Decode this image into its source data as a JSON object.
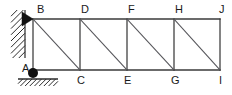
{
  "figure": {
    "background_color": "#ffffff",
    "line_color": "#3a3a3a",
    "label_color": "#1a1a1a",
    "width_px": 232,
    "height_px": 95
  },
  "geometry": {
    "top_chord_y": 19,
    "bottom_chord_y": 70,
    "panel_x": [
      33,
      80,
      127,
      174,
      220
    ],
    "panel_count": 4
  },
  "nodes": [
    {
      "id": "B",
      "label": "B",
      "x": 33,
      "y": 19,
      "chord": "top",
      "label_x": 37,
      "label_y": 13
    },
    {
      "id": "D",
      "label": "D",
      "x": 80,
      "y": 19,
      "chord": "top",
      "label_x": 81,
      "label_y": 13
    },
    {
      "id": "F",
      "label": "F",
      "x": 127,
      "y": 19,
      "chord": "top",
      "label_x": 128,
      "label_y": 13
    },
    {
      "id": "H",
      "label": "H",
      "x": 174,
      "y": 19,
      "chord": "top",
      "label_x": 175,
      "label_y": 13
    },
    {
      "id": "J",
      "label": "J",
      "x": 220,
      "y": 19,
      "chord": "top",
      "label_x": 219,
      "label_y": 13
    },
    {
      "id": "A",
      "label": "A",
      "x": 33,
      "y": 70,
      "chord": "bottom",
      "label_x": 22,
      "label_y": 72
    },
    {
      "id": "C",
      "label": "C",
      "x": 80,
      "y": 70,
      "chord": "bottom",
      "label_x": 77,
      "label_y": 84
    },
    {
      "id": "E",
      "label": "E",
      "x": 127,
      "y": 70,
      "chord": "bottom",
      "label_x": 124,
      "label_y": 84
    },
    {
      "id": "G",
      "label": "G",
      "x": 174,
      "y": 70,
      "chord": "bottom",
      "label_x": 171,
      "label_y": 84
    },
    {
      "id": "I",
      "label": "I",
      "x": 220,
      "y": 70,
      "chord": "bottom",
      "label_x": 219,
      "label_y": 84
    }
  ],
  "members": {
    "top_chord": {
      "from": "B",
      "to": "J",
      "x1": 33,
      "y1": 19,
      "x2": 220,
      "y2": 19
    },
    "bottom_chord": {
      "from": "A",
      "to": "I",
      "x1": 33,
      "y1": 70,
      "x2": 220,
      "y2": 70
    },
    "verticals": [
      {
        "from": "B",
        "to": "A",
        "x": 33,
        "y1": 19,
        "y2": 70
      },
      {
        "from": "D",
        "to": "C",
        "x": 80,
        "y1": 19,
        "y2": 70
      },
      {
        "from": "F",
        "to": "E",
        "x": 127,
        "y1": 19,
        "y2": 70
      },
      {
        "from": "H",
        "to": "G",
        "x": 174,
        "y1": 19,
        "y2": 70
      },
      {
        "from": "J",
        "to": "I",
        "x": 220,
        "y1": 19,
        "y2": 70
      }
    ],
    "diagonals": [
      {
        "from": "B",
        "to": "C",
        "x1": 33,
        "y1": 19,
        "x2": 80,
        "y2": 70
      },
      {
        "from": "D",
        "to": "E",
        "x1": 80,
        "y1": 19,
        "x2": 127,
        "y2": 70
      },
      {
        "from": "F",
        "to": "G",
        "x1": 127,
        "y1": 19,
        "x2": 174,
        "y2": 70
      },
      {
        "from": "H",
        "to": "I",
        "x1": 174,
        "y1": 19,
        "x2": 220,
        "y2": 70
      }
    ]
  },
  "supports": {
    "wall": {
      "kind": "hatched-wall",
      "x_left": 11,
      "x_right": 25,
      "y_top": 10,
      "y_bottom": 58,
      "hatch_count": 9
    },
    "pin_at_B": {
      "kind": "pin-triangle",
      "apex_x": 33,
      "apex_y": 19,
      "base_x": 22,
      "half_height": 7
    },
    "ground": {
      "kind": "hatched-ground",
      "x_left": 18,
      "x_right": 58,
      "y": 79,
      "hatch_count": 9
    },
    "pin_at_A": {
      "kind": "filled-circle",
      "cx": 33,
      "cy": 73,
      "r": 5
    }
  }
}
